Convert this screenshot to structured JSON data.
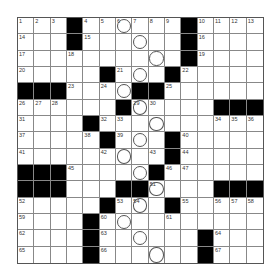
{
  "puzzle": {
    "size": 15,
    "rows": [
      "...#......#....",
      "...#......#....",
      "..........#....",
      ".....#...#.....",
      "###....##......",
      "......#.....###",
      "....#..........",
      ".....#...#.....",
      ".........#.....",
      "###.....#......",
      "###...##....###",
      ".....#...#.....",
      "....#..........",
      "....#......#...",
      "....#......#..."
    ],
    "numbers": [
      {
        "r": 0,
        "c": 0,
        "n": "1"
      },
      {
        "r": 0,
        "c": 1,
        "n": "2"
      },
      {
        "r": 0,
        "c": 2,
        "n": "3"
      },
      {
        "r": 0,
        "c": 4,
        "n": "4"
      },
      {
        "r": 0,
        "c": 5,
        "n": "5"
      },
      {
        "r": 0,
        "c": 6,
        "n": "6"
      },
      {
        "r": 0,
        "c": 7,
        "n": "7"
      },
      {
        "r": 0,
        "c": 8,
        "n": "8"
      },
      {
        "r": 0,
        "c": 9,
        "n": "9"
      },
      {
        "r": 0,
        "c": 11,
        "n": "10"
      },
      {
        "r": 0,
        "c": 12,
        "n": "11"
      },
      {
        "r": 0,
        "c": 13,
        "n": "12"
      },
      {
        "r": 0,
        "c": 14,
        "n": "13"
      },
      {
        "r": 1,
        "c": 0,
        "n": "14"
      },
      {
        "r": 1,
        "c": 4,
        "n": "15"
      },
      {
        "r": 1,
        "c": 11,
        "n": "16"
      },
      {
        "r": 2,
        "c": 0,
        "n": "17"
      },
      {
        "r": 2,
        "c": 3,
        "n": "18"
      },
      {
        "r": 2,
        "c": 11,
        "n": "19"
      },
      {
        "r": 3,
        "c": 0,
        "n": "20"
      },
      {
        "r": 3,
        "c": 6,
        "n": "21"
      },
      {
        "r": 3,
        "c": 10,
        "n": "22"
      },
      {
        "r": 4,
        "c": 3,
        "n": "23"
      },
      {
        "r": 4,
        "c": 5,
        "n": "24"
      },
      {
        "r": 4,
        "c": 9,
        "n": "25"
      },
      {
        "r": 5,
        "c": 0,
        "n": "26"
      },
      {
        "r": 5,
        "c": 1,
        "n": "27"
      },
      {
        "r": 5,
        "c": 2,
        "n": "28"
      },
      {
        "r": 5,
        "c": 7,
        "n": "29"
      },
      {
        "r": 5,
        "c": 8,
        "n": "30"
      },
      {
        "r": 6,
        "c": 0,
        "n": "31"
      },
      {
        "r": 6,
        "c": 5,
        "n": "32"
      },
      {
        "r": 6,
        "c": 6,
        "n": "33"
      },
      {
        "r": 6,
        "c": 12,
        "n": "34"
      },
      {
        "r": 6,
        "c": 13,
        "n": "35"
      },
      {
        "r": 6,
        "c": 14,
        "n": "36"
      },
      {
        "r": 7,
        "c": 0,
        "n": "37"
      },
      {
        "r": 7,
        "c": 4,
        "n": "38"
      },
      {
        "r": 7,
        "c": 6,
        "n": "39"
      },
      {
        "r": 7,
        "c": 10,
        "n": "40"
      },
      {
        "r": 8,
        "c": 0,
        "n": "41"
      },
      {
        "r": 8,
        "c": 5,
        "n": "42"
      },
      {
        "r": 8,
        "c": 8,
        "n": "43"
      },
      {
        "r": 8,
        "c": 10,
        "n": "44"
      },
      {
        "r": 9,
        "c": 3,
        "n": "45"
      },
      {
        "r": 9,
        "c": 9,
        "n": "46"
      },
      {
        "r": 9,
        "c": 10,
        "n": "47"
      },
      {
        "r": 10,
        "c": 0,
        "n": "48"
      },
      {
        "r": 10,
        "c": 1,
        "n": "49"
      },
      {
        "r": 10,
        "c": 2,
        "n": "50"
      },
      {
        "r": 10,
        "c": 8,
        "n": "51"
      },
      {
        "r": 11,
        "c": 0,
        "n": "52"
      },
      {
        "r": 11,
        "c": 6,
        "n": "53"
      },
      {
        "r": 11,
        "c": 7,
        "n": "54"
      },
      {
        "r": 11,
        "c": 10,
        "n": "55"
      },
      {
        "r": 11,
        "c": 12,
        "n": "56"
      },
      {
        "r": 11,
        "c": 13,
        "n": "57"
      },
      {
        "r": 11,
        "c": 14,
        "n": "58"
      },
      {
        "r": 12,
        "c": 0,
        "n": "59"
      },
      {
        "r": 12,
        "c": 5,
        "n": "60"
      },
      {
        "r": 12,
        "c": 9,
        "n": "61"
      },
      {
        "r": 13,
        "c": 0,
        "n": "62"
      },
      {
        "r": 13,
        "c": 5,
        "n": "63"
      },
      {
        "r": 13,
        "c": 12,
        "n": "64"
      },
      {
        "r": 14,
        "c": 0,
        "n": "65"
      },
      {
        "r": 14,
        "c": 5,
        "n": "66"
      },
      {
        "r": 14,
        "c": 12,
        "n": "67"
      }
    ],
    "circles": [
      {
        "r": 0,
        "c": 6
      },
      {
        "r": 1,
        "c": 7
      },
      {
        "r": 2,
        "c": 8
      },
      {
        "r": 3,
        "c": 7
      },
      {
        "r": 4,
        "c": 6
      },
      {
        "r": 5,
        "c": 7
      },
      {
        "r": 6,
        "c": 8
      },
      {
        "r": 7,
        "c": 7
      },
      {
        "r": 8,
        "c": 6
      },
      {
        "r": 9,
        "c": 7
      },
      {
        "r": 10,
        "c": 8
      },
      {
        "r": 11,
        "c": 7
      },
      {
        "r": 12,
        "c": 6
      },
      {
        "r": 13,
        "c": 7
      },
      {
        "r": 14,
        "c": 8
      }
    ],
    "colors": {
      "block": "#000000",
      "cell": "#ffffff",
      "line": "#888888"
    }
  }
}
